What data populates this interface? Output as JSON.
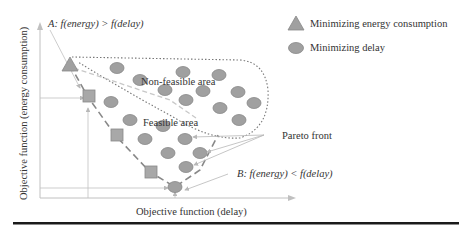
{
  "diagram": {
    "type": "pareto-front-illustration",
    "x_axis_label": "Objective function (delay)",
    "y_axis_label": "Objective function (energy consumption)",
    "annotations": {
      "point_a": "A: f(energy) > f(delay)",
      "point_b": "B: f(energy) < f(delay)",
      "non_feasible": "Non-feasible area",
      "feasible": "Feasible area",
      "pareto_front": "Pareto front"
    },
    "legend": [
      {
        "shape": "triangle",
        "label": "Minimizing energy consumption"
      },
      {
        "shape": "circle",
        "label": "Minimizing delay"
      }
    ],
    "colors": {
      "marker_fill": "#a0a0a0",
      "marker_stroke": "#8a8a8a",
      "axis": "#b0b0b0",
      "text": "#333333",
      "rule": "#1a1a1a"
    }
  }
}
